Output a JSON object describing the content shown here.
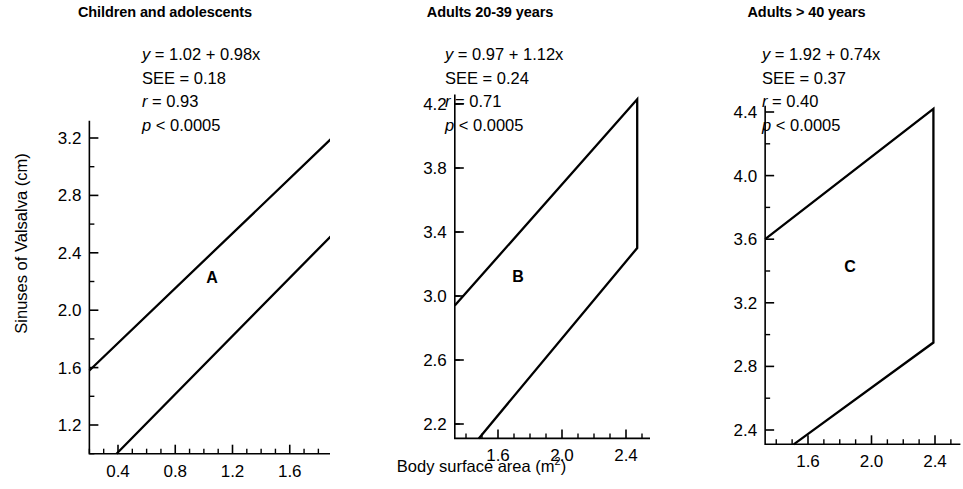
{
  "figure": {
    "x_axis_title": "Body surface area (m",
    "x_axis_title_sup": "2",
    "x_axis_title_end": ")",
    "y_axis_title": "Sinuses of Valsalva (cm)"
  },
  "chart_data": [
    {
      "type": "line",
      "panel_letter": "A",
      "title": "Children and adolescents",
      "xlabel": "Body surface area (m2)",
      "ylabel": "Sinuses of Valsalva (cm)",
      "xlim": [
        0.2,
        2.12
      ],
      "ylim": [
        1.0,
        3.32
      ],
      "xticks": [
        0.4,
        0.8,
        1.2,
        1.6,
        2.0
      ],
      "xtick_labels": [
        "0.4",
        "0.8",
        "1.2",
        "1.6",
        "2.0"
      ],
      "yticks": [
        1.2,
        1.6,
        2.0,
        2.4,
        2.8,
        3.2
      ],
      "ytick_labels": [
        "1.2",
        "1.6",
        "2.0",
        "2.4",
        "2.8",
        "3.2"
      ],
      "xminor_step": 0.1,
      "yminor_step": 0.2,
      "annotations": {
        "equation_var": "y",
        "equation": " = 1.02 + 0.98x",
        "see_label": "SEE",
        "see": " = 0.18",
        "r_var": "r",
        "r": " = 0.93",
        "p_var": "p",
        "p": " < 0.0005"
      },
      "band": {
        "upper": [
          [
            0.2,
            1.58
          ],
          [
            2.0,
            3.3
          ]
        ],
        "lower": [
          [
            0.39,
            1.0
          ],
          [
            2.0,
            2.63
          ]
        ]
      }
    },
    {
      "type": "line",
      "panel_letter": "B",
      "title": "Adults 20-39 years",
      "xlabel": "Body surface area (m2)",
      "ylabel": "Sinuses of Valsalva (cm)",
      "xlim": [
        1.33,
        2.56
      ],
      "ylim": [
        2.11,
        4.26
      ],
      "xticks": [
        1.6,
        2.0,
        2.4
      ],
      "xtick_labels": [
        "1.6",
        "2.0",
        "2.4"
      ],
      "yticks": [
        2.2,
        2.6,
        3.0,
        3.4,
        3.8,
        4.2
      ],
      "ytick_labels": [
        "2.2",
        "2.6",
        "3.0",
        "3.4",
        "3.8",
        "4.2"
      ],
      "xminor_step": 0.1,
      "yminor_step": 0.2,
      "annotations": {
        "equation_var": "y",
        "equation": " = 0.97 + 1.12x",
        "see_label": "SEE",
        "see": " = 0.24",
        "r_var": "r",
        "r": " = 0.71",
        "p_var": "p",
        "p": " < 0.0005"
      },
      "band": {
        "upper": [
          [
            1.33,
            2.94
          ],
          [
            2.47,
            4.23
          ]
        ],
        "lower": [
          [
            1.48,
            2.11
          ],
          [
            2.47,
            3.3
          ]
        ]
      }
    },
    {
      "type": "line",
      "panel_letter": "C",
      "title": "Adults > 40 years",
      "xlabel": "Body surface area (m2)",
      "ylabel": "Sinuses of Valsalva (cm)",
      "xlim": [
        1.33,
        2.56
      ],
      "ylim": [
        2.31,
        4.44
      ],
      "xticks": [
        1.6,
        2.0,
        2.4
      ],
      "xtick_labels": [
        "1.6",
        "2.0",
        "2.4"
      ],
      "yticks": [
        2.4,
        2.8,
        3.2,
        3.6,
        4.0,
        4.4
      ],
      "ytick_labels": [
        "2.4",
        "2.8",
        "3.2",
        "3.6",
        "4.0",
        "4.4"
      ],
      "xminor_step": 0.1,
      "yminor_step": 0.2,
      "annotations": {
        "equation_var": "y",
        "equation": " = 1.92 + 0.74x",
        "see_label": "SEE",
        "see": " = 0.37",
        "r_var": "r",
        "r": " = 0.40",
        "p_var": "p",
        "p": " < 0.0005"
      },
      "band": {
        "upper": [
          [
            1.33,
            3.6
          ],
          [
            2.39,
            4.42
          ]
        ],
        "lower": [
          [
            1.51,
            2.31
          ],
          [
            2.39,
            2.95
          ]
        ]
      }
    }
  ]
}
